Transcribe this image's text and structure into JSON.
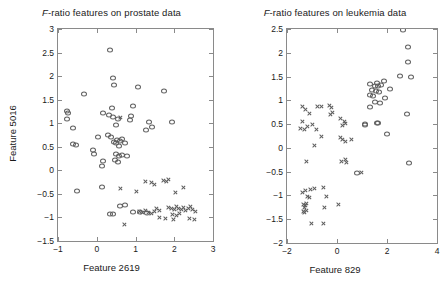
{
  "figure": {
    "panels": [
      {
        "id": "prostate",
        "title_prefix": "F",
        "title_rest": "-ratio features on prostate data",
        "xlabel": "Feature 2619",
        "ylabel": "Feature 5016",
        "xticks": [
          "-1",
          "0",
          "1",
          "2",
          "3"
        ],
        "yticks": [
          "3",
          "2.5",
          "2",
          "1.5",
          "1",
          "0.5",
          "0",
          "-0.5",
          "-1",
          "-1.5"
        ]
      },
      {
        "id": "leukemia",
        "title_prefix": "F",
        "title_rest": "-ratio features on leukemia data",
        "xlabel": "Feature 829",
        "ylabel": "Feature 378",
        "xticks": [
          "-2",
          "0",
          "2",
          "4"
        ],
        "yticks": [
          "2.5",
          "2",
          "1.5",
          "1",
          "0.5",
          "0",
          "-0.5",
          "-1",
          "-1.5",
          "-2"
        ]
      }
    ]
  },
  "chart_data": [
    {
      "type": "scatter",
      "title": "F-ratio features on prostate data",
      "xlabel": "Feature 2619",
      "ylabel": "Feature 5016",
      "xlim": [
        -1,
        3
      ],
      "ylim": [
        -1.5,
        3
      ],
      "xticks": [
        -1,
        0,
        1,
        2,
        3
      ],
      "yticks": [
        -1.5,
        -1,
        -0.5,
        0,
        0.5,
        1,
        1.5,
        2,
        2.5,
        3
      ],
      "grid": false,
      "legend": "none",
      "series": [
        {
          "name": "class-circle",
          "marker": "circle",
          "points": [
            [
              0.33,
              2.55
            ],
            [
              0.43,
              1.97
            ],
            [
              0.45,
              1.81
            ],
            [
              -0.33,
              1.61
            ],
            [
              1.07,
              1.77
            ],
            [
              1.73,
              1.68
            ],
            [
              0.39,
              1.32
            ],
            [
              0.93,
              1.37
            ],
            [
              0.88,
              1.16
            ],
            [
              -0.77,
              1.25
            ],
            [
              -0.73,
              1.21
            ],
            [
              -0.78,
              1.08
            ],
            [
              0.16,
              1.21
            ],
            [
              0.31,
              1.18
            ],
            [
              0.42,
              1.13
            ],
            [
              0.55,
              1.1
            ],
            [
              0.87,
              1.07
            ],
            [
              1.95,
              1.02
            ],
            [
              -0.62,
              0.9
            ],
            [
              0.49,
              0.96
            ],
            [
              1.42,
              0.92
            ],
            [
              1.28,
              0.86
            ],
            [
              1.35,
              1.03
            ],
            [
              -0.53,
              0.53
            ],
            [
              -0.62,
              0.55
            ],
            [
              0.02,
              0.7
            ],
            [
              0.3,
              0.74
            ],
            [
              0.38,
              0.7
            ],
            [
              0.53,
              0.64
            ],
            [
              0.6,
              0.62
            ],
            [
              0.66,
              0.66
            ],
            [
              0.72,
              0.59
            ],
            [
              0.44,
              0.6
            ],
            [
              0.5,
              0.57
            ],
            [
              0.58,
              0.52
            ],
            [
              -0.1,
              0.43
            ],
            [
              -0.07,
              0.34
            ],
            [
              0.5,
              0.35
            ],
            [
              0.58,
              0.31
            ],
            [
              0.64,
              0.33
            ],
            [
              0.78,
              0.31
            ],
            [
              0.15,
              0.19
            ],
            [
              0.13,
              0.1
            ],
            [
              0.48,
              0.22
            ],
            [
              0.55,
              0.18
            ],
            [
              -0.52,
              -0.44
            ],
            [
              0.13,
              -0.36
            ],
            [
              0.6,
              -0.75
            ],
            [
              0.72,
              -0.74
            ],
            [
              0.35,
              -0.92
            ],
            [
              0.43,
              -0.92
            ],
            [
              0.94,
              -0.88
            ],
            [
              1.12,
              -0.88
            ],
            [
              1.3,
              -0.9
            ]
          ]
        },
        {
          "name": "class-cross",
          "marker": "cross",
          "points": [
            [
              0.62,
              1.12
            ],
            [
              1.25,
              -0.24
            ],
            [
              1.4,
              -0.26
            ],
            [
              1.48,
              -0.31
            ],
            [
              1.72,
              -0.21
            ],
            [
              1.8,
              -0.23
            ],
            [
              1.86,
              -0.2
            ],
            [
              0.6,
              -0.39
            ],
            [
              2.25,
              -0.36
            ],
            [
              1.03,
              -0.45
            ],
            [
              2.02,
              -0.47
            ],
            [
              1.55,
              -0.82
            ],
            [
              1.62,
              -0.85
            ],
            [
              1.85,
              -0.78
            ],
            [
              1.92,
              -0.81
            ],
            [
              2.0,
              -0.84
            ],
            [
              2.06,
              -0.76
            ],
            [
              2.12,
              -0.8
            ],
            [
              2.18,
              -0.83
            ],
            [
              2.24,
              -0.79
            ],
            [
              2.3,
              -0.85
            ],
            [
              2.36,
              -0.8
            ],
            [
              2.42,
              -0.76
            ],
            [
              2.48,
              -0.83
            ],
            [
              2.55,
              -0.88
            ],
            [
              1.1,
              -0.88
            ],
            [
              1.18,
              -0.9
            ],
            [
              1.26,
              -0.86
            ],
            [
              1.33,
              -0.89
            ],
            [
              1.42,
              -0.92
            ],
            [
              1.5,
              -0.87
            ],
            [
              1.95,
              -0.93
            ],
            [
              2.05,
              -0.95
            ],
            [
              2.14,
              -0.92
            ],
            [
              1.62,
              -1.0
            ],
            [
              1.78,
              -1.02
            ],
            [
              1.98,
              -1.04
            ],
            [
              2.4,
              -1.02
            ],
            [
              2.52,
              -1.05
            ],
            [
              0.72,
              -1.16
            ]
          ]
        }
      ]
    },
    {
      "type": "scatter",
      "title": "F-ratio features on leukemia data",
      "xlabel": "Feature 829",
      "ylabel": "Feature 378",
      "xlim": [
        -2,
        4
      ],
      "ylim": [
        -2,
        2.5
      ],
      "xticks": [
        -2,
        0,
        2,
        4
      ],
      "yticks": [
        -2,
        -1.5,
        -1,
        -0.5,
        0,
        0.5,
        1,
        1.5,
        2,
        2.5
      ],
      "grid": false,
      "legend": "none",
      "series": [
        {
          "name": "class-circle",
          "marker": "circle",
          "points": [
            [
              2.65,
              2.48
            ],
            [
              2.82,
              2.13
            ],
            [
              2.82,
              1.8
            ],
            [
              2.5,
              1.52
            ],
            [
              2.95,
              1.5
            ],
            [
              1.58,
              1.36
            ],
            [
              1.86,
              1.4
            ],
            [
              1.3,
              1.35
            ],
            [
              1.5,
              1.31
            ],
            [
              1.62,
              1.3
            ],
            [
              1.74,
              1.32
            ],
            [
              1.38,
              1.22
            ],
            [
              1.55,
              1.2
            ],
            [
              1.66,
              1.18
            ],
            [
              1.3,
              1.12
            ],
            [
              1.44,
              1.1
            ],
            [
              2.1,
              1.24
            ],
            [
              1.92,
              1.05
            ],
            [
              1.52,
              0.97
            ],
            [
              1.72,
              0.95
            ],
            [
              1.32,
              0.87
            ],
            [
              2.8,
              0.72
            ],
            [
              1.12,
              0.5
            ],
            [
              1.58,
              0.52
            ],
            [
              1.12,
              0.48
            ],
            [
              1.62,
              0.52
            ],
            [
              2.0,
              0.3
            ],
            [
              2.88,
              -0.31
            ],
            [
              0.78,
              -0.53
            ]
          ]
        },
        {
          "name": "class-cross",
          "marker": "cross",
          "points": [
            [
              -1.38,
              0.88
            ],
            [
              -1.25,
              0.8
            ],
            [
              -0.78,
              0.87
            ],
            [
              -0.62,
              0.86
            ],
            [
              -0.3,
              0.9
            ],
            [
              -0.22,
              0.84
            ],
            [
              -0.18,
              0.74
            ],
            [
              -0.28,
              0.7
            ],
            [
              -1.1,
              0.72
            ],
            [
              -1.4,
              0.56
            ],
            [
              -0.98,
              0.49
            ],
            [
              0.12,
              0.62
            ],
            [
              0.3,
              0.56
            ],
            [
              0.22,
              0.48
            ],
            [
              0.35,
              0.52
            ],
            [
              -1.48,
              0.4
            ],
            [
              -1.32,
              0.38
            ],
            [
              -1.18,
              0.44
            ],
            [
              -0.82,
              0.38
            ],
            [
              -0.62,
              0.25
            ],
            [
              0.12,
              0.22
            ],
            [
              0.22,
              0.18
            ],
            [
              0.32,
              0.14
            ],
            [
              0.58,
              0.18
            ],
            [
              -0.92,
              0.06
            ],
            [
              -1.22,
              -0.29
            ],
            [
              0.18,
              -0.28
            ],
            [
              0.35,
              -0.25
            ],
            [
              0.38,
              -0.31
            ],
            [
              0.98,
              -0.51
            ],
            [
              -1.38,
              -0.94
            ],
            [
              -1.25,
              -0.9
            ],
            [
              -1.05,
              -0.88
            ],
            [
              -0.92,
              -0.86
            ],
            [
              -0.55,
              -0.83
            ],
            [
              -1.18,
              -1.02
            ],
            [
              -1.1,
              -1.05
            ],
            [
              -0.42,
              -1.03
            ],
            [
              -1.34,
              -1.18
            ],
            [
              -1.28,
              -1.22
            ],
            [
              -1.22,
              -1.16
            ],
            [
              -1.3,
              -1.26
            ],
            [
              -0.5,
              -1.26
            ],
            [
              0.05,
              -1.2
            ],
            [
              -1.36,
              -1.34
            ],
            [
              -1.3,
              -1.36
            ],
            [
              -1.24,
              -1.32
            ],
            [
              -1.02,
              -1.6
            ],
            [
              -0.55,
              -1.58
            ]
          ]
        }
      ]
    }
  ]
}
